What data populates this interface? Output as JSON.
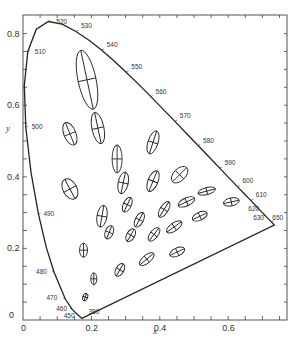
{
  "chart_data": {
    "type": "scatter",
    "xlabel": "x",
    "ylabel": "y",
    "xlim": [
      0,
      0.772
    ],
    "ylim": [
      0,
      0.853
    ],
    "grid": false,
    "x_ticks": [
      "0",
      "0.2",
      "0.4",
      "0.6"
    ],
    "y_ticks": [
      "0",
      "0.2",
      "0.4",
      "0.6",
      "0.8"
    ],
    "spectral_locus_labels": [
      {
        "nm": "380",
        "x": 0.174,
        "y": 0.005
      },
      {
        "nm": "450",
        "x": 0.157,
        "y": 0.018
      },
      {
        "nm": "460",
        "x": 0.144,
        "y": 0.03
      },
      {
        "nm": "470",
        "x": 0.124,
        "y": 0.058
      },
      {
        "nm": "480",
        "x": 0.091,
        "y": 0.133
      },
      {
        "nm": "490",
        "x": 0.045,
        "y": 0.295
      },
      {
        "nm": "500",
        "x": 0.008,
        "y": 0.538
      },
      {
        "nm": "510",
        "x": 0.014,
        "y": 0.75
      },
      {
        "nm": "520",
        "x": 0.074,
        "y": 0.834
      },
      {
        "nm": "530",
        "x": 0.155,
        "y": 0.806
      },
      {
        "nm": "540",
        "x": 0.23,
        "y": 0.754
      },
      {
        "nm": "550",
        "x": 0.302,
        "y": 0.692
      },
      {
        "nm": "560",
        "x": 0.373,
        "y": 0.624
      },
      {
        "nm": "570",
        "x": 0.444,
        "y": 0.555
      },
      {
        "nm": "580",
        "x": 0.512,
        "y": 0.487
      },
      {
        "nm": "590",
        "x": 0.575,
        "y": 0.424
      },
      {
        "nm": "600",
        "x": 0.627,
        "y": 0.373
      },
      {
        "nm": "610",
        "x": 0.666,
        "y": 0.334
      },
      {
        "nm": "620",
        "x": 0.691,
        "y": 0.308
      },
      {
        "nm": "630",
        "x": 0.708,
        "y": 0.292
      },
      {
        "nm": "650",
        "x": 0.726,
        "y": 0.274
      }
    ],
    "ellipses": [
      {
        "x": 0.187,
        "y": 0.671,
        "rx_px": 9,
        "ry_px": 30,
        "rot": -12
      },
      {
        "x": 0.219,
        "y": 0.536,
        "rx_px": 6,
        "ry_px": 16,
        "rot": -12
      },
      {
        "x": 0.137,
        "y": 0.52,
        "rx_px": 6,
        "ry_px": 12,
        "rot": -22
      },
      {
        "x": 0.275,
        "y": 0.45,
        "rx_px": 5,
        "ry_px": 14,
        "rot": 0
      },
      {
        "x": 0.293,
        "y": 0.383,
        "rx_px": 5,
        "ry_px": 11,
        "rot": 12
      },
      {
        "x": 0.38,
        "y": 0.496,
        "rx_px": 5,
        "ry_px": 12,
        "rot": 18
      },
      {
        "x": 0.38,
        "y": 0.388,
        "rx_px": 5,
        "ry_px": 11,
        "rot": 22
      },
      {
        "x": 0.458,
        "y": 0.406,
        "rx_px": 6,
        "ry_px": 10,
        "rot": 45
      },
      {
        "x": 0.137,
        "y": 0.366,
        "rx_px": 7,
        "ry_px": 11,
        "rot": -28
      },
      {
        "x": 0.305,
        "y": 0.322,
        "rx_px": 4,
        "ry_px": 8,
        "rot": 25
      },
      {
        "x": 0.34,
        "y": 0.28,
        "rx_px": 4,
        "ry_px": 8,
        "rot": 28
      },
      {
        "x": 0.413,
        "y": 0.309,
        "rx_px": 4,
        "ry_px": 9,
        "rot": 32
      },
      {
        "x": 0.478,
        "y": 0.33,
        "rx_px": 4,
        "ry_px": 9,
        "rot": 65
      },
      {
        "x": 0.537,
        "y": 0.36,
        "rx_px": 3.5,
        "ry_px": 9,
        "rot": 75
      },
      {
        "x": 0.231,
        "y": 0.29,
        "rx_px": 5,
        "ry_px": 11,
        "rot": 10
      },
      {
        "x": 0.177,
        "y": 0.195,
        "rx_px": 4,
        "ry_px": 7,
        "rot": 0
      },
      {
        "x": 0.252,
        "y": 0.245,
        "rx_px": 4,
        "ry_px": 7,
        "rot": 22
      },
      {
        "x": 0.315,
        "y": 0.237,
        "rx_px": 4,
        "ry_px": 7,
        "rot": 30
      },
      {
        "x": 0.383,
        "y": 0.239,
        "rx_px": 4,
        "ry_px": 8,
        "rot": 38
      },
      {
        "x": 0.442,
        "y": 0.26,
        "rx_px": 4,
        "ry_px": 9,
        "rot": 55
      },
      {
        "x": 0.517,
        "y": 0.29,
        "rx_px": 4,
        "ry_px": 8,
        "rot": 65
      },
      {
        "x": 0.609,
        "y": 0.33,
        "rx_px": 4,
        "ry_px": 8,
        "rot": 78
      },
      {
        "x": 0.207,
        "y": 0.115,
        "rx_px": 3,
        "ry_px": 6,
        "rot": 0
      },
      {
        "x": 0.283,
        "y": 0.14,
        "rx_px": 4,
        "ry_px": 7,
        "rot": 30
      },
      {
        "x": 0.362,
        "y": 0.17,
        "rx_px": 4,
        "ry_px": 9,
        "rot": 50
      },
      {
        "x": 0.451,
        "y": 0.19,
        "rx_px": 4,
        "ry_px": 8,
        "rot": 65
      },
      {
        "x": 0.182,
        "y": 0.064,
        "rx_px": 2.5,
        "ry_px": 4,
        "rot": 20
      }
    ]
  },
  "axes": {
    "x_label": "x",
    "y_label": "y",
    "x_ticks": [
      {
        "v": 0,
        "label": "0"
      },
      {
        "v": 0.2,
        "label": "0.2"
      },
      {
        "v": 0.4,
        "label": "0.4"
      },
      {
        "v": 0.6,
        "label": "0.6"
      }
    ],
    "y_ticks": [
      {
        "v": 0,
        "label": "0"
      },
      {
        "v": 0.2,
        "label": "0.2"
      },
      {
        "v": 0.4,
        "label": "0.4"
      },
      {
        "v": 0.6,
        "label": "0.6"
      },
      {
        "v": 0.8,
        "label": "0.8"
      }
    ],
    "origin_x_label": "0",
    "origin_y_label": "0"
  }
}
